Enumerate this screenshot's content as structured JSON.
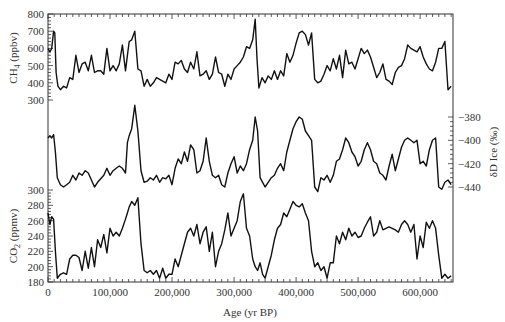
{
  "chart_data": {
    "type": "line",
    "title": "",
    "xlabel": "Age (yr BP)",
    "xlim": [
      0,
      653000
    ],
    "x_ticks": [
      0,
      100000,
      200000,
      300000,
      400000,
      500000,
      600000
    ],
    "x_tick_labels": [
      "0",
      "100,000",
      "200,000",
      "300,000",
      "400,000",
      "500,000",
      "600,000"
    ],
    "panels": [
      {
        "name": "CH4",
        "ylabel": "CH4 (ppbv)",
        "ylabel_main": "CH",
        "ylabel_sub": "4",
        "ylabel_unit": " (ppbv)",
        "axis_side": "left",
        "ylim": [
          300,
          800
        ],
        "y_ticks": [
          300,
          400,
          500,
          600,
          700,
          800
        ],
        "x": [
          0,
          3000,
          6000,
          9000,
          11000,
          13000,
          16000,
          20000,
          25000,
          30000,
          35000,
          40000,
          45000,
          50000,
          55000,
          60000,
          65000,
          70000,
          75000,
          80000,
          85000,
          90000,
          95000,
          100000,
          105000,
          110000,
          115000,
          120000,
          125000,
          128000,
          131000,
          135000,
          140000,
          145000,
          150000,
          155000,
          160000,
          165000,
          170000,
          175000,
          180000,
          185000,
          190000,
          195000,
          200000,
          205000,
          210000,
          215000,
          220000,
          225000,
          230000,
          235000,
          240000,
          245000,
          250000,
          255000,
          260000,
          265000,
          270000,
          275000,
          280000,
          285000,
          290000,
          295000,
          300000,
          305000,
          310000,
          315000,
          320000,
          325000,
          330000,
          334000,
          337000,
          340000,
          345000,
          350000,
          355000,
          360000,
          365000,
          370000,
          375000,
          380000,
          385000,
          390000,
          395000,
          400000,
          405000,
          410000,
          415000,
          420000,
          425000,
          430000,
          435000,
          440000,
          445000,
          450000,
          455000,
          460000,
          465000,
          470000,
          475000,
          480000,
          485000,
          490000,
          495000,
          500000,
          505000,
          510000,
          515000,
          520000,
          525000,
          530000,
          535000,
          540000,
          545000,
          550000,
          555000,
          560000,
          565000,
          570000,
          575000,
          580000,
          585000,
          590000,
          595000,
          600000,
          605000,
          610000,
          615000,
          620000,
          625000,
          630000,
          635000,
          640000,
          645000,
          650000
        ],
        "values": [
          600,
          580,
          600,
          700,
          690,
          460,
          380,
          360,
          380,
          370,
          430,
          420,
          560,
          460,
          510,
          520,
          470,
          560,
          460,
          470,
          470,
          450,
          600,
          470,
          500,
          470,
          510,
          620,
          470,
          560,
          640,
          650,
          700,
          480,
          470,
          380,
          420,
          380,
          400,
          430,
          420,
          410,
          400,
          450,
          420,
          520,
          510,
          530,
          480,
          460,
          520,
          480,
          580,
          440,
          450,
          470,
          420,
          450,
          550,
          460,
          450,
          380,
          450,
          420,
          480,
          500,
          520,
          550,
          610,
          600,
          650,
          770,
          540,
          370,
          430,
          400,
          440,
          420,
          470,
          420,
          470,
          440,
          570,
          520,
          560,
          630,
          690,
          700,
          680,
          620,
          690,
          420,
          400,
          410,
          450,
          500,
          470,
          540,
          480,
          560,
          430,
          590,
          510,
          520,
          480,
          540,
          600,
          570,
          590,
          550,
          490,
          430,
          460,
          510,
          420,
          410,
          390,
          460,
          490,
          500,
          540,
          620,
          600,
          590,
          580,
          610,
          550,
          510,
          480,
          470,
          520,
          600,
          600,
          640,
          360,
          380
        ],
        "color": "#111111"
      },
      {
        "name": "deltaD",
        "ylabel": "δD Ice (‰)",
        "axis_side": "right",
        "ylim": [
          -445,
          -365
        ],
        "y_ticks": [
          -440,
          -420,
          -400,
          -380
        ],
        "x": [
          0,
          3000,
          6000,
          9000,
          12000,
          15000,
          20000,
          25000,
          30000,
          35000,
          40000,
          45000,
          50000,
          55000,
          60000,
          65000,
          70000,
          75000,
          80000,
          85000,
          90000,
          95000,
          100000,
          105000,
          110000,
          115000,
          120000,
          125000,
          128000,
          131000,
          135000,
          140000,
          145000,
          150000,
          155000,
          160000,
          165000,
          170000,
          175000,
          180000,
          185000,
          190000,
          195000,
          200000,
          205000,
          210000,
          215000,
          220000,
          225000,
          230000,
          235000,
          240000,
          245000,
          250000,
          255000,
          260000,
          265000,
          270000,
          275000,
          280000,
          285000,
          290000,
          295000,
          300000,
          305000,
          310000,
          315000,
          320000,
          325000,
          330000,
          334000,
          338000,
          342000,
          346000,
          350000,
          355000,
          360000,
          365000,
          370000,
          375000,
          380000,
          385000,
          390000,
          395000,
          400000,
          405000,
          410000,
          415000,
          420000,
          425000,
          430000,
          435000,
          440000,
          445000,
          450000,
          455000,
          460000,
          465000,
          470000,
          475000,
          480000,
          485000,
          490000,
          495000,
          500000,
          505000,
          510000,
          515000,
          520000,
          525000,
          530000,
          535000,
          540000,
          545000,
          550000,
          555000,
          560000,
          565000,
          570000,
          575000,
          580000,
          585000,
          590000,
          595000,
          600000,
          605000,
          610000,
          615000,
          620000,
          625000,
          630000,
          635000,
          640000,
          645000,
          650000
        ],
        "values": [
          -398,
          -396,
          -398,
          -395,
          -410,
          -432,
          -438,
          -440,
          -438,
          -436,
          -430,
          -434,
          -428,
          -430,
          -426,
          -428,
          -434,
          -440,
          -436,
          -433,
          -430,
          -424,
          -430,
          -426,
          -424,
          -422,
          -424,
          -428,
          -402,
          -396,
          -390,
          -370,
          -392,
          -426,
          -436,
          -435,
          -432,
          -434,
          -430,
          -436,
          -432,
          -433,
          -430,
          -438,
          -424,
          -416,
          -420,
          -410,
          -418,
          -404,
          -408,
          -428,
          -426,
          -418,
          -398,
          -418,
          -430,
          -432,
          -430,
          -438,
          -440,
          -428,
          -420,
          -414,
          -428,
          -422,
          -426,
          -420,
          -408,
          -400,
          -380,
          -392,
          -432,
          -436,
          -440,
          -436,
          -432,
          -430,
          -424,
          -420,
          -426,
          -410,
          -400,
          -390,
          -384,
          -380,
          -382,
          -392,
          -396,
          -400,
          -440,
          -444,
          -432,
          -434,
          -430,
          -436,
          -430,
          -418,
          -416,
          -408,
          -398,
          -402,
          -410,
          -414,
          -422,
          -418,
          -408,
          -402,
          -408,
          -418,
          -420,
          -428,
          -430,
          -434,
          -422,
          -412,
          -426,
          -416,
          -406,
          -400,
          -398,
          -400,
          -402,
          -400,
          -420,
          -418,
          -422,
          -408,
          -400,
          -398,
          -440,
          -442,
          -436,
          -434,
          -438,
          -432
        ],
        "color": "#111111"
      },
      {
        "name": "CO2",
        "ylabel": "CO2 (ppmv)",
        "ylabel_main": "CO",
        "ylabel_sub": "2",
        "ylabel_unit": " (ppmv)",
        "axis_side": "left",
        "ylim": [
          180,
          300
        ],
        "y_ticks": [
          180,
          200,
          220,
          240,
          260,
          280,
          300
        ],
        "x": [
          0,
          3000,
          6000,
          9000,
          12000,
          15000,
          20000,
          25000,
          30000,
          35000,
          40000,
          45000,
          50000,
          55000,
          60000,
          65000,
          70000,
          75000,
          80000,
          85000,
          90000,
          95000,
          100000,
          105000,
          110000,
          115000,
          120000,
          125000,
          128000,
          131000,
          135000,
          140000,
          145000,
          150000,
          155000,
          160000,
          165000,
          170000,
          175000,
          180000,
          185000,
          190000,
          195000,
          200000,
          205000,
          210000,
          215000,
          220000,
          225000,
          230000,
          235000,
          240000,
          245000,
          250000,
          255000,
          260000,
          265000,
          270000,
          275000,
          280000,
          285000,
          290000,
          295000,
          300000,
          305000,
          310000,
          315000,
          320000,
          325000,
          330000,
          334000,
          338000,
          342000,
          346000,
          350000,
          355000,
          360000,
          365000,
          370000,
          375000,
          380000,
          385000,
          390000,
          395000,
          400000,
          405000,
          410000,
          415000,
          420000,
          425000,
          430000,
          435000,
          440000,
          445000,
          450000,
          455000,
          460000,
          465000,
          470000,
          475000,
          480000,
          485000,
          490000,
          495000,
          500000,
          505000,
          510000,
          515000,
          520000,
          525000,
          530000,
          535000,
          540000,
          545000,
          550000,
          555000,
          560000,
          565000,
          570000,
          575000,
          580000,
          585000,
          590000,
          595000,
          600000,
          605000,
          610000,
          615000,
          620000,
          625000,
          630000,
          635000,
          640000,
          645000,
          650000
        ],
        "values": [
          270,
          255,
          265,
          262,
          220,
          185,
          190,
          192,
          190,
          210,
          215,
          215,
          212,
          195,
          220,
          198,
          225,
          200,
          235,
          225,
          242,
          218,
          250,
          240,
          245,
          240,
          250,
          262,
          270,
          278,
          285,
          280,
          290,
          230,
          195,
          192,
          195,
          190,
          195,
          185,
          198,
          185,
          190,
          190,
          210,
          200,
          215,
          230,
          245,
          250,
          240,
          255,
          230,
          245,
          252,
          220,
          245,
          200,
          220,
          230,
          248,
          270,
          240,
          250,
          260,
          285,
          295,
          250,
          240,
          210,
          200,
          195,
          205,
          190,
          185,
          200,
          215,
          235,
          250,
          255,
          270,
          265,
          275,
          285,
          280,
          278,
          282,
          270,
          260,
          220,
          200,
          205,
          195,
          200,
          185,
          205,
          205,
          240,
          230,
          245,
          235,
          250,
          240,
          245,
          238,
          240,
          250,
          258,
          265,
          240,
          245,
          260,
          248,
          250,
          252,
          250,
          248,
          245,
          255,
          260,
          255,
          245,
          255,
          210,
          240,
          225,
          258,
          250,
          260,
          250,
          215,
          185,
          190,
          185,
          188,
          182
        ],
        "color": "#111111"
      }
    ],
    "grid": false,
    "legend": null
  },
  "axes": {
    "x_label": "Age (yr BP)",
    "ch4_label_main": "CH",
    "ch4_label_sub": "4",
    "ch4_label_unit": " (ppbv)",
    "co2_label_main": "CO",
    "co2_label_sub": "2",
    "co2_label_unit": " (ppmv)",
    "dd_label": "δD Ice (‰)"
  }
}
